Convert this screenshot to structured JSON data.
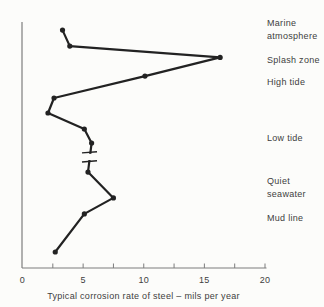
{
  "figure": {
    "caption": "Typical corrosion rate of steel – mils per year"
  },
  "colors": {
    "background": "#fcfcfa",
    "line": "#222222",
    "axis": "#7d7d7d",
    "text": "#3e3e3e"
  },
  "chart_data": {
    "type": "line",
    "title": "",
    "xlabel": "Typical corrosion rate of steel – mils per year",
    "ylabel": "",
    "xlim": [
      0,
      20
    ],
    "x_tick_labels": [
      "0",
      "5",
      "10",
      "15",
      "20"
    ],
    "x_tick_values": [
      0,
      5,
      10,
      15,
      20
    ],
    "x_minor_tick_step": 2.5,
    "grid": false,
    "orientation": "depth-profile (depth increases downward, y-axis unscaled)",
    "series": [
      {
        "name": "steel-corrosion-rate-profile",
        "points": [
          {
            "rate_mils_per_year": 3.3,
            "depth_pct": 3.3,
            "zone": "Marine atmosphere"
          },
          {
            "rate_mils_per_year": 3.9,
            "depth_pct": 9.8,
            "zone": "Marine atmosphere"
          },
          {
            "rate_mils_per_year": 16.3,
            "depth_pct": 14.4,
            "zone": "Splash zone"
          },
          {
            "rate_mils_per_year": 10.1,
            "depth_pct": 22.0,
            "zone": "High tide"
          },
          {
            "rate_mils_per_year": 2.6,
            "depth_pct": 30.9,
            "zone": ""
          },
          {
            "rate_mils_per_year": 2.1,
            "depth_pct": 37.0,
            "zone": ""
          },
          {
            "rate_mils_per_year": 5.1,
            "depth_pct": 43.5,
            "zone": "Low tide"
          },
          {
            "rate_mils_per_year": 5.7,
            "depth_pct": 49.2,
            "zone": "Low tide"
          },
          {
            "rate_mils_per_year": 5.4,
            "depth_pct": 61.0,
            "zone": "Quiet seawater"
          },
          {
            "rate_mils_per_year": 7.5,
            "depth_pct": 71.5,
            "zone": "Quiet seawater"
          },
          {
            "rate_mils_per_year": 5.1,
            "depth_pct": 78.0,
            "zone": "Mud line"
          },
          {
            "rate_mils_per_year": 2.7,
            "depth_pct": 93.5,
            "zone": "Mud line"
          }
        ],
        "line_break": {
          "after_point_index": 7,
          "tick_depth_pct": [
            53.0,
            56.7
          ],
          "gap_depth_pct": [
            53.6,
            56.1
          ]
        }
      }
    ],
    "zone_labels": [
      {
        "label": "Marine atmosphere",
        "lines": [
          "Marine",
          "atmosphere"
        ]
      },
      {
        "label": "Splash zone",
        "lines": [
          "Splash zone"
        ]
      },
      {
        "label": "High tide",
        "lines": [
          "High tide"
        ]
      },
      {
        "label": "Low tide",
        "lines": [
          "Low tide"
        ]
      },
      {
        "label": "Quiet seawater",
        "lines": [
          "Quiet",
          "seawater"
        ]
      },
      {
        "label": "Mud line",
        "lines": [
          "Mud line"
        ]
      }
    ]
  }
}
